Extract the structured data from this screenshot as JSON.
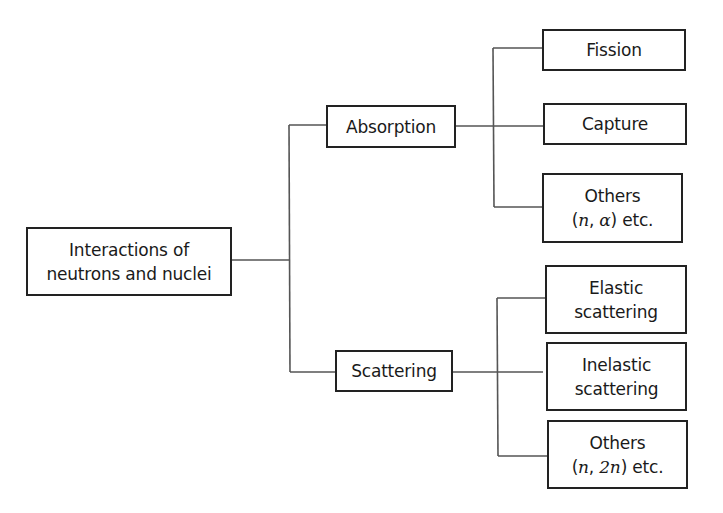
{
  "diagram": {
    "type": "tree",
    "root": {
      "id": "root",
      "lines": [
        "Interactions of",
        "neutrons and nuclei"
      ]
    },
    "branches": [
      {
        "id": "absorption",
        "label": "Absorption",
        "children": [
          {
            "id": "fission",
            "lines": [
              "Fission"
            ]
          },
          {
            "id": "capture",
            "lines": [
              "Capture"
            ]
          },
          {
            "id": "absorption-others",
            "lines": [
              "Others",
              "(n, α) etc."
            ],
            "formula": {
              "open": "(",
              "a": "n",
              "sep": ", ",
              "b": "α",
              "close": ") etc."
            }
          }
        ]
      },
      {
        "id": "scattering",
        "label": "Scattering",
        "children": [
          {
            "id": "elastic",
            "lines": [
              "Elastic",
              "scattering"
            ]
          },
          {
            "id": "inelastic",
            "lines": [
              "Inelastic",
              "scattering"
            ]
          },
          {
            "id": "scattering-others",
            "lines": [
              "Others",
              "(n, 2n) etc."
            ],
            "formula": {
              "open": "(",
              "a": "n",
              "sep": ", ",
              "b": "2n",
              "close": ") etc."
            }
          }
        ]
      }
    ],
    "colors": {
      "box_border": "#222222",
      "connector": "#555555",
      "background": "#ffffff"
    }
  }
}
